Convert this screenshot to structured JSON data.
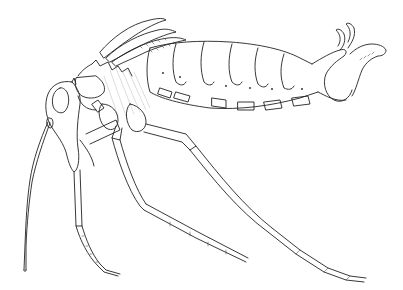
{
  "image": {
    "subject": "Insect line drawing (lateral view)",
    "style": "black ink scientific illustration on white background",
    "colors": {
      "background": "#ffffff",
      "ink": "#222222"
    },
    "parts": [
      {
        "id": "head",
        "label": "Head"
      },
      {
        "id": "antenna",
        "label": "Antenna"
      },
      {
        "id": "thorax",
        "label": "Thorax"
      },
      {
        "id": "wings",
        "label": "Wing pads"
      },
      {
        "id": "abdomen",
        "label": "Abdomen",
        "segments": 6
      },
      {
        "id": "terminalia",
        "label": "Terminal claspers"
      },
      {
        "id": "foreleg",
        "label": "Foreleg"
      },
      {
        "id": "midleg",
        "label": "Middle leg"
      },
      {
        "id": "hindleg",
        "label": "Hind leg"
      }
    ]
  }
}
